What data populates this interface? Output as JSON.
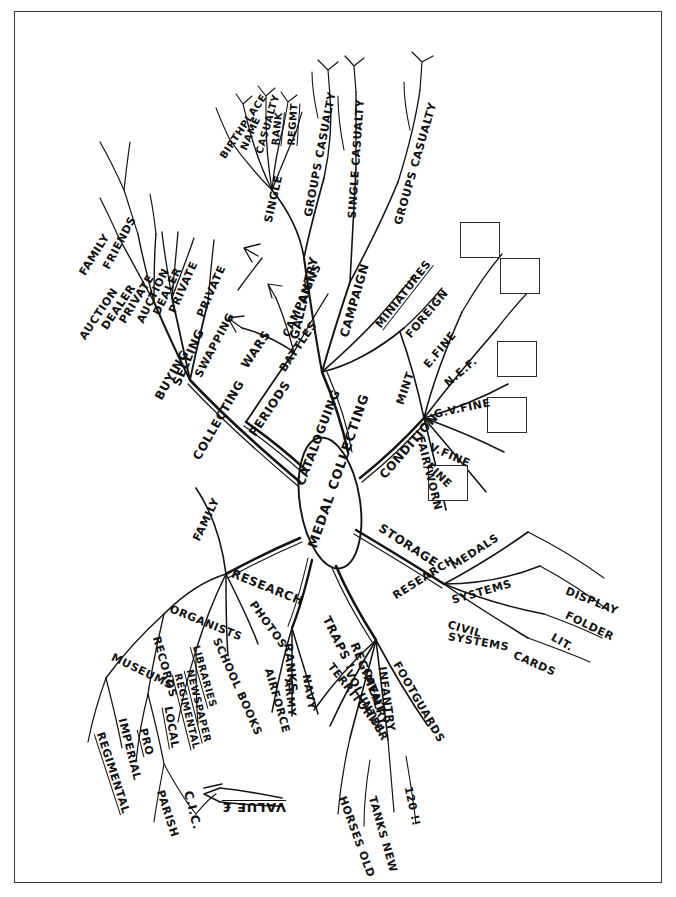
{
  "center": {
    "label": "MEDAL COLLECTING"
  },
  "annotations": {
    "value": "VALUE £",
    "traps": "TRAPS !",
    "count": "120 !!"
  },
  "branches": [
    {
      "id": "cataloguing",
      "label": "CATALOGUING",
      "children": [
        {
          "label": "GALLANTRY",
          "children": [
            {
              "label": "SINGLE",
              "children": [
                {
                  "label": "BIRTHPLACE"
                },
                {
                  "label": "NAME"
                },
                {
                  "label": "CASUALTY"
                },
                {
                  "label": "RANK"
                },
                {
                  "label": "REGMT"
                }
              ]
            },
            {
              "label": "GROUPS CASUALTY"
            }
          ]
        },
        {
          "label": "CAMPAIGN",
          "children": [
            {
              "label": "SINGLE CASUALTY"
            },
            {
              "label": "GROUPS CASUALTY"
            }
          ]
        },
        {
          "label": "MINIATURES"
        },
        {
          "label": "FOREIGN"
        }
      ]
    },
    {
      "id": "condition",
      "label": "CONDITION",
      "children": [
        {
          "label": "MINT"
        },
        {
          "label": "E.FINE"
        },
        {
          "label": "N.E.F."
        },
        {
          "label": "G.V.FINE"
        },
        {
          "label": "V.FINE"
        },
        {
          "label": "FINE"
        },
        {
          "label": "FAIR/WORN"
        }
      ]
    },
    {
      "id": "storage",
      "label": "STORAGE",
      "children": [
        {
          "label": "MEDALS"
        },
        {
          "label": "RESEARCH"
        },
        {
          "label": "SYSTEMS"
        },
        {
          "label": "SYSTEMS"
        },
        {
          "label": "CIVIL"
        },
        {
          "label": "CARDS"
        },
        {
          "label": "LIT."
        },
        {
          "label": "FOLDER"
        },
        {
          "label": "DISPLAY"
        }
      ]
    },
    {
      "id": "regiment",
      "label": "REGIMENT",
      "children": [
        {
          "label": "TERRITORIAL"
        },
        {
          "label": "VOLUNTEER"
        },
        {
          "label": "CAVALRY",
          "children": [
            {
              "label": "HORSES OLD"
            }
          ]
        },
        {
          "label": "INFANTRY",
          "children": [
            {
              "label": "TANKS NEW"
            }
          ]
        },
        {
          "label": "FOOTGUARDS"
        }
      ]
    },
    {
      "id": "ranks",
      "label": "RANKS",
      "children": [
        {
          "label": "AIRFORCE"
        },
        {
          "label": "ARMY"
        },
        {
          "label": "NAVY"
        }
      ]
    },
    {
      "id": "research",
      "label": "RESEARCH",
      "children": [
        {
          "label": "FAMILY"
        },
        {
          "label": "ORGANISTS"
        },
        {
          "label": "MUSEUMS",
          "children": [
            {
              "label": "REGIMENTAL"
            },
            {
              "label": "IMPERIAL"
            }
          ]
        },
        {
          "label": "RECORDS",
          "children": [
            {
              "label": "PRO"
            },
            {
              "label": "LOCAL"
            },
            {
              "label": "PARISH"
            },
            {
              "label": "C.I.C."
            }
          ]
        },
        {
          "label": "LIBRARIES",
          "children": [
            {
              "label": "REGIMENTAL"
            },
            {
              "label": "NEWSPAPER"
            }
          ]
        },
        {
          "label": "SCHOOL BOOKS"
        },
        {
          "label": "PHOTOS"
        }
      ]
    },
    {
      "id": "periods",
      "label": "PERIODS",
      "children": [
        {
          "label": "WARS",
          "children": [
            {
              "label": "CAMPAIGNS"
            },
            {
              "label": "BATTLES"
            }
          ]
        }
      ]
    },
    {
      "id": "collecting",
      "label": "COLLECTING",
      "children": [
        {
          "label": "BUYING",
          "children": [
            {
              "label": "AUCTION"
            },
            {
              "label": "DEALER"
            },
            {
              "label": "PRIVATE",
              "children": [
                {
                  "label": "FAMILY"
                },
                {
                  "label": "FRIENDS"
                }
              ]
            }
          ]
        },
        {
          "label": "SELLING",
          "children": [
            {
              "label": "AUCTION"
            },
            {
              "label": "DEALER"
            },
            {
              "label": "PRIVATE"
            }
          ]
        },
        {
          "label": "SWAPPING",
          "children": [
            {
              "label": "PRIVATE"
            }
          ]
        }
      ]
    }
  ],
  "condition_boxes": 5,
  "colors": {
    "ink": "#111111",
    "frame": "#3b3b3b"
  }
}
